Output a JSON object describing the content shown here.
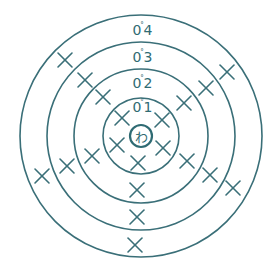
{
  "diagram": {
    "type": "bohr-shell-diagram",
    "colors": {
      "line": "#3a6f78",
      "text": "#2f6b73",
      "background": "#ffffff"
    },
    "center": {
      "x": 141,
      "y": 136
    },
    "nucleus": {
      "label": "わ",
      "radius": 11
    },
    "shells": [
      {
        "index": 1,
        "radius": 38,
        "label_prefix": "0",
        "label_mark": "˚",
        "label_digit": "1",
        "label_x": 141,
        "label_y": 112
      },
      {
        "index": 2,
        "radius": 67,
        "label_prefix": "0",
        "label_mark": "˚",
        "label_digit": "2",
        "label_x": 141,
        "label_y": 88
      },
      {
        "index": 3,
        "radius": 94,
        "label_prefix": "0",
        "label_mark": "˚",
        "label_digit": "3",
        "label_x": 141,
        "label_y": 62
      },
      {
        "index": 4,
        "radius": 121,
        "label_prefix": "0",
        "label_mark": "˚",
        "label_digit": "4",
        "label_x": 141,
        "label_y": 35
      }
    ],
    "electrons": [
      {
        "shell": 1,
        "x": 122,
        "y": 118
      },
      {
        "shell": 1,
        "x": 162,
        "y": 120
      },
      {
        "shell": 1,
        "x": 117,
        "y": 145
      },
      {
        "shell": 1,
        "x": 163,
        "y": 148
      },
      {
        "shell": 1,
        "x": 138,
        "y": 163
      },
      {
        "shell": 2,
        "x": 103,
        "y": 97
      },
      {
        "shell": 2,
        "x": 184,
        "y": 103
      },
      {
        "shell": 2,
        "x": 92,
        "y": 156
      },
      {
        "shell": 2,
        "x": 187,
        "y": 161
      },
      {
        "shell": 2,
        "x": 137,
        "y": 190
      },
      {
        "shell": 3,
        "x": 85,
        "y": 80
      },
      {
        "shell": 3,
        "x": 206,
        "y": 88
      },
      {
        "shell": 3,
        "x": 67,
        "y": 166
      },
      {
        "shell": 3,
        "x": 210,
        "y": 175
      },
      {
        "shell": 3,
        "x": 137,
        "y": 217
      },
      {
        "shell": 4,
        "x": 65,
        "y": 60
      },
      {
        "shell": 4,
        "x": 227,
        "y": 72
      },
      {
        "shell": 4,
        "x": 42,
        "y": 176
      },
      {
        "shell": 4,
        "x": 233,
        "y": 188
      },
      {
        "shell": 4,
        "x": 135,
        "y": 245
      }
    ]
  }
}
